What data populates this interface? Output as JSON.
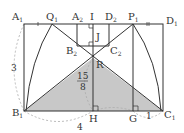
{
  "diagram": {
    "colors": {
      "line": "#333333",
      "shade": "#c8c8c8",
      "dashed": "#aaaaaa",
      "background": "#ffffff"
    },
    "points": {
      "A1": {
        "label": "A",
        "sub": "1",
        "x": 24,
        "y": 24
      },
      "Q1": {
        "label": "Q",
        "sub": "1",
        "x": 52,
        "y": 24
      },
      "A2": {
        "label": "A",
        "sub": "2",
        "x": 77,
        "y": 24
      },
      "I": {
        "label": "I",
        "sub": "",
        "x": 93,
        "y": 24
      },
      "D2": {
        "label": "D",
        "sub": "2",
        "x": 109,
        "y": 24
      },
      "P1": {
        "label": "P",
        "sub": "1",
        "x": 133,
        "y": 24
      },
      "D1": {
        "label": "D",
        "sub": "1",
        "x": 163,
        "y": 24
      },
      "B2": {
        "label": "B",
        "sub": "2",
        "x": 77,
        "y": 46
      },
      "J": {
        "label": "J",
        "sub": "",
        "x": 93,
        "y": 38
      },
      "C2": {
        "label": "C",
        "sub": "2",
        "x": 109,
        "y": 46
      },
      "R": {
        "label": "R",
        "sub": "",
        "x": 93,
        "y": 58
      },
      "B1": {
        "label": "B",
        "sub": "1",
        "x": 24,
        "y": 111
      },
      "H": {
        "label": "H",
        "sub": "",
        "x": 93,
        "y": 111
      },
      "G": {
        "label": "G",
        "sub": "",
        "x": 133,
        "y": 111
      },
      "C1": {
        "label": "C",
        "sub": "1",
        "x": 163,
        "y": 111
      }
    },
    "measurements": {
      "left_side": "3",
      "bottom": "4",
      "GC1": "1",
      "RH_num": "15",
      "RH_den": "8"
    },
    "labels": {
      "A1": "A₁",
      "Q1": "Q₁",
      "A2": "A₂",
      "I": "I",
      "D2": "D₂",
      "P1": "P₁",
      "D1": "D₁",
      "B2": "B₂",
      "J": "J",
      "C2": "C₂",
      "R": "R",
      "B1": "B₁",
      "H": "H",
      "G": "G",
      "C1": "C₁"
    }
  }
}
